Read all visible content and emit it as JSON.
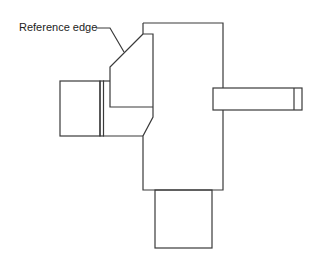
{
  "diagram": {
    "type": "technical-line-drawing",
    "stroke_color": "#3a3a3a",
    "background": "#ffffff",
    "annotations": [
      {
        "id": "reference-edge",
        "text": "Reference edge"
      }
    ],
    "components": [
      "main-body",
      "angled-reference-block",
      "left-cylinder",
      "spacer-strip",
      "right-arm",
      "right-arm-tip",
      "bottom-block"
    ]
  }
}
